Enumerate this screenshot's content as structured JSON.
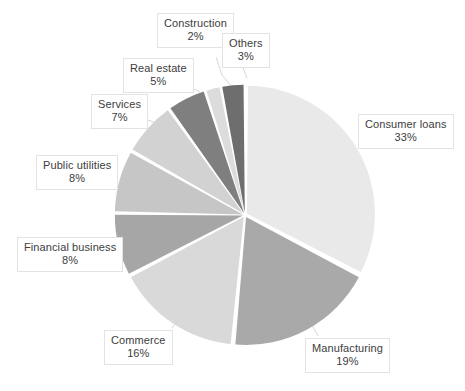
{
  "chart_data": {
    "type": "pie",
    "title": "",
    "subtitle": "",
    "xlabel": "",
    "ylabel": "",
    "legend_position": "none",
    "grid": false,
    "labels_show_percent": true,
    "start_angle_deg": 0,
    "direction": "clockwise",
    "categories": [
      "Consumer loans",
      "Manufacturing",
      "Commerce",
      "Financial business",
      "Public utilities",
      "Services",
      "Real estate",
      "Construction",
      "Others"
    ],
    "values": [
      33,
      19,
      16,
      8,
      8,
      7,
      5,
      2,
      3
    ],
    "value_labels": [
      "33%",
      "19%",
      "16%",
      "8%",
      "8%",
      "7%",
      "5%",
      "2%",
      "3%"
    ],
    "units": "percent",
    "total": 101,
    "slices": [
      {
        "name": "Consumer loans",
        "value": 33,
        "label": "33%",
        "color": "#e9e9e9"
      },
      {
        "name": "Manufacturing",
        "value": 19,
        "label": "19%",
        "color": "#a9a9a9"
      },
      {
        "name": "Commerce",
        "value": 16,
        "label": "16%",
        "color": "#d9d9d9"
      },
      {
        "name": "Financial business",
        "value": 8,
        "label": "8%",
        "color": "#a6a6a6"
      },
      {
        "name": "Public utilities",
        "value": 8,
        "label": "8%",
        "color": "#c6c6c6"
      },
      {
        "name": "Services",
        "value": 7,
        "label": "7%",
        "color": "#d2d2d2"
      },
      {
        "name": "Real estate",
        "value": 5,
        "label": "5%",
        "color": "#7f7f7f"
      },
      {
        "name": "Construction",
        "value": 2,
        "label": "2%",
        "color": "#dcdcdc"
      },
      {
        "name": "Others",
        "value": 3,
        "label": "3%",
        "color": "#6e6e6e"
      }
    ]
  },
  "labels": {
    "consumer_loans": {
      "name": "Consumer loans",
      "pct": "33%"
    },
    "manufacturing": {
      "name": "Manufacturing",
      "pct": "19%"
    },
    "commerce": {
      "name": "Commerce",
      "pct": "16%"
    },
    "financial_business": {
      "name": "Financial business",
      "pct": "8%"
    },
    "public_utilities": {
      "name": "Public utilities",
      "pct": "8%"
    },
    "services": {
      "name": "Services",
      "pct": "7%"
    },
    "real_estate": {
      "name": "Real estate",
      "pct": "5%"
    },
    "construction": {
      "name": "Construction",
      "pct": "2%"
    },
    "others": {
      "name": "Others",
      "pct": "3%"
    }
  },
  "colors": {
    "background": "#ffffff",
    "label_text": "#3d3d3d",
    "label_box_border": "#e3e3e3",
    "label_box_fill": "#ffffff",
    "leader_line": "#d0d0d0",
    "slice_gap": "#ffffff"
  }
}
